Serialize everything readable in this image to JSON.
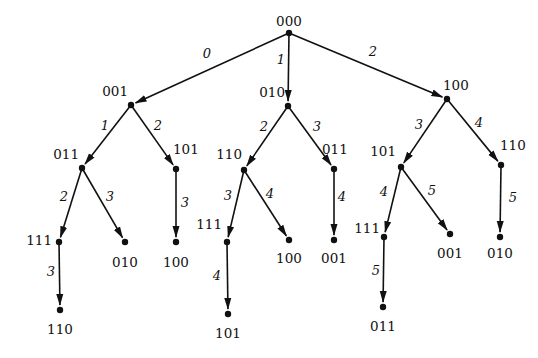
{
  "diagram": {
    "type": "tree",
    "nodes": [
      {
        "id": "n0",
        "label": "000",
        "x": 289,
        "y": 33,
        "lx": 289,
        "ly": 26,
        "anchor": "middle"
      },
      {
        "id": "n1",
        "label": "001",
        "x": 131,
        "y": 105,
        "lx": 128,
        "ly": 96,
        "anchor": "end"
      },
      {
        "id": "n2",
        "label": "010",
        "x": 288,
        "y": 106,
        "lx": 285,
        "ly": 97,
        "anchor": "end"
      },
      {
        "id": "n3",
        "label": "100",
        "x": 447,
        "y": 99,
        "lx": 443,
        "ly": 90,
        "anchor": "start"
      },
      {
        "id": "n4",
        "label": "011",
        "x": 82,
        "y": 168,
        "lx": 79,
        "ly": 159,
        "anchor": "end"
      },
      {
        "id": "n5",
        "label": "101",
        "x": 176,
        "y": 169,
        "lx": 173,
        "ly": 154,
        "anchor": "start"
      },
      {
        "id": "n6",
        "label": "110",
        "x": 244,
        "y": 170,
        "lx": 242,
        "ly": 159,
        "anchor": "end"
      },
      {
        "id": "n7",
        "label": "011",
        "x": 334,
        "y": 169,
        "lx": 322,
        "ly": 154,
        "anchor": "start"
      },
      {
        "id": "n8",
        "label": "101",
        "x": 401,
        "y": 167,
        "lx": 396,
        "ly": 156,
        "anchor": "end"
      },
      {
        "id": "n9",
        "label": "110",
        "x": 501,
        "y": 165,
        "lx": 500,
        "ly": 150,
        "anchor": "start"
      },
      {
        "id": "n10",
        "label": "111",
        "x": 59,
        "y": 242,
        "lx": 52,
        "ly": 245,
        "anchor": "end"
      },
      {
        "id": "n11",
        "label": "010",
        "x": 125,
        "y": 242,
        "lx": 125,
        "ly": 267,
        "anchor": "middle"
      },
      {
        "id": "n12",
        "label": "100",
        "x": 176,
        "y": 242,
        "lx": 176,
        "ly": 267,
        "anchor": "middle"
      },
      {
        "id": "n13",
        "label": "111",
        "x": 227,
        "y": 242,
        "lx": 222,
        "ly": 229,
        "anchor": "end"
      },
      {
        "id": "n14",
        "label": "100",
        "x": 289,
        "y": 240,
        "lx": 289,
        "ly": 263,
        "anchor": "middle"
      },
      {
        "id": "n15",
        "label": "001",
        "x": 334,
        "y": 240,
        "lx": 334,
        "ly": 263,
        "anchor": "middle"
      },
      {
        "id": "n16",
        "label": "111",
        "x": 384,
        "y": 237,
        "lx": 380,
        "ly": 233,
        "anchor": "end"
      },
      {
        "id": "n17",
        "label": "001",
        "x": 450,
        "y": 234,
        "lx": 450,
        "ly": 258,
        "anchor": "middle"
      },
      {
        "id": "n18",
        "label": "010",
        "x": 500,
        "y": 237,
        "lx": 500,
        "ly": 258,
        "anchor": "middle"
      },
      {
        "id": "n19",
        "label": "110",
        "x": 60,
        "y": 310,
        "lx": 60,
        "ly": 334,
        "anchor": "middle"
      },
      {
        "id": "n20",
        "label": "101",
        "x": 228,
        "y": 314,
        "lx": 228,
        "ly": 338,
        "anchor": "middle"
      },
      {
        "id": "n21",
        "label": "011",
        "x": 383,
        "y": 307,
        "lx": 383,
        "ly": 331,
        "anchor": "middle"
      }
    ],
    "edges": [
      {
        "from": "n0",
        "to": "n1",
        "label": "0",
        "lx": 207,
        "ly": 58
      },
      {
        "from": "n0",
        "to": "n2",
        "label": "1",
        "lx": 281,
        "ly": 64
      },
      {
        "from": "n0",
        "to": "n3",
        "label": "2",
        "lx": 373,
        "ly": 56
      },
      {
        "from": "n1",
        "to": "n4",
        "label": "1",
        "lx": 105,
        "ly": 130
      },
      {
        "from": "n1",
        "to": "n5",
        "label": "2",
        "lx": 158,
        "ly": 130
      },
      {
        "from": "n2",
        "to": "n6",
        "label": "2",
        "lx": 264,
        "ly": 131
      },
      {
        "from": "n2",
        "to": "n7",
        "label": "3",
        "lx": 317,
        "ly": 131
      },
      {
        "from": "n3",
        "to": "n8",
        "label": "3",
        "lx": 419,
        "ly": 129
      },
      {
        "from": "n3",
        "to": "n9",
        "label": "4",
        "lx": 479,
        "ly": 127
      },
      {
        "from": "n4",
        "to": "n10",
        "label": "2",
        "lx": 64,
        "ly": 201
      },
      {
        "from": "n4",
        "to": "n11",
        "label": "3",
        "lx": 110,
        "ly": 201
      },
      {
        "from": "n5",
        "to": "n12",
        "label": "3",
        "lx": 185,
        "ly": 207
      },
      {
        "from": "n6",
        "to": "n13",
        "label": "3",
        "lx": 228,
        "ly": 200
      },
      {
        "from": "n6",
        "to": "n14",
        "label": "4",
        "lx": 270,
        "ly": 198
      },
      {
        "from": "n7",
        "to": "n15",
        "label": "4",
        "lx": 342,
        "ly": 201
      },
      {
        "from": "n8",
        "to": "n16",
        "label": "4",
        "lx": 384,
        "ly": 196
      },
      {
        "from": "n8",
        "to": "n17",
        "label": "5",
        "lx": 432,
        "ly": 195
      },
      {
        "from": "n9",
        "to": "n18",
        "label": "5",
        "lx": 513,
        "ly": 202
      },
      {
        "from": "n10",
        "to": "n19",
        "label": "3",
        "lx": 51,
        "ly": 276
      },
      {
        "from": "n13",
        "to": "n20",
        "label": "4",
        "lx": 217,
        "ly": 280
      },
      {
        "from": "n16",
        "to": "n21",
        "label": "5",
        "lx": 376,
        "ly": 275
      }
    ]
  }
}
